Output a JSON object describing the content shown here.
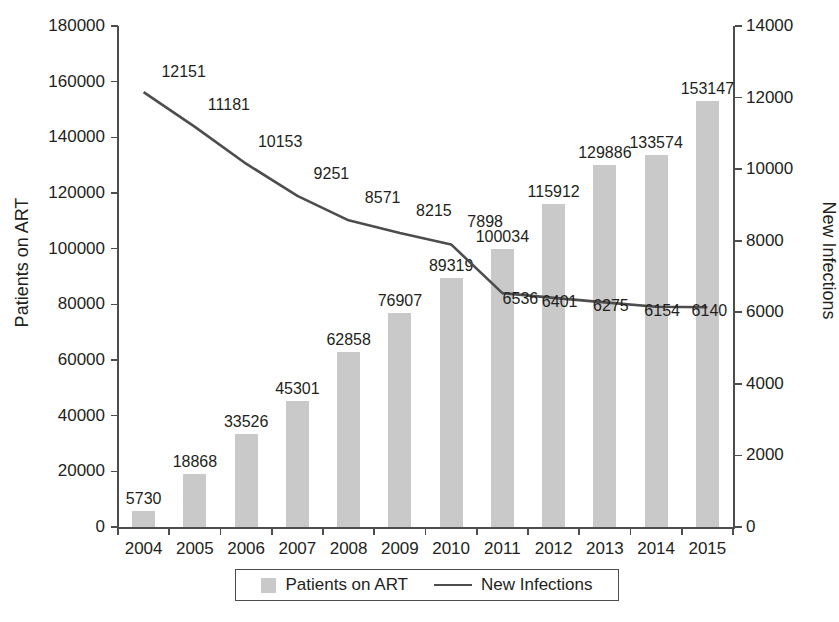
{
  "chart_data": {
    "type": "bar",
    "title": "",
    "xlabel": "",
    "categories": [
      "2004",
      "2005",
      "2006",
      "2007",
      "2008",
      "2009",
      "2010",
      "2011",
      "2012",
      "2013",
      "2014",
      "2015"
    ],
    "grid": false,
    "legend_position": "bottom",
    "series": [
      {
        "name": "Patients on ART",
        "type": "bar",
        "axis": "left",
        "color": "#c9c9c9",
        "values": [
          5730,
          18868,
          33526,
          45301,
          62858,
          76907,
          89319,
          100034,
          115912,
          129886,
          133574,
          153147
        ],
        "labels": [
          "5730",
          "18868",
          "33526",
          "45301",
          "62858",
          "76907",
          "89319",
          "100034",
          "115912",
          "129886",
          "133574",
          "153147"
        ]
      },
      {
        "name": "New Infections",
        "type": "line",
        "axis": "right",
        "color": "#4d4d4d",
        "values": [
          12151,
          11181,
          10153,
          9251,
          8571,
          8215,
          7898,
          6536,
          6401,
          6275,
          6154,
          6140
        ],
        "labels": [
          "12151",
          "11181",
          "10153",
          "9251",
          "8571",
          "8215",
          "7898",
          "6536",
          "6401",
          "6275",
          "6154",
          "6140"
        ]
      }
    ],
    "y_left": {
      "label": "Patients on ART",
      "ylim": [
        0,
        180000
      ],
      "ticks": [
        0,
        20000,
        40000,
        60000,
        80000,
        100000,
        120000,
        140000,
        160000,
        180000
      ],
      "ticklabels": [
        "0",
        "20000",
        "40000",
        "60000",
        "80000",
        "100000",
        "120000",
        "140000",
        "160000",
        "180000"
      ]
    },
    "y_right": {
      "label": "New Infections",
      "ylim": [
        0,
        14000
      ],
      "ticks": [
        0,
        2000,
        4000,
        6000,
        8000,
        10000,
        12000,
        14000
      ],
      "ticklabels": [
        "0",
        "2000",
        "4000",
        "6000",
        "8000",
        "10000",
        "12000",
        "14000"
      ]
    },
    "legend": [
      {
        "label": "Patients on ART",
        "marker": "swatch"
      },
      {
        "label": "New Infections",
        "marker": "line"
      }
    ]
  }
}
